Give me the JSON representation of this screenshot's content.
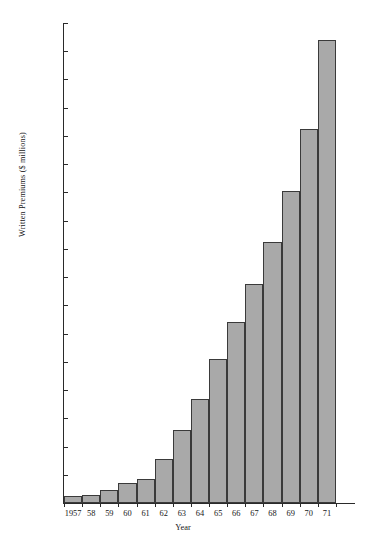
{
  "chart_data": {
    "type": "bar",
    "title": "",
    "xlabel": "Year",
    "ylabel": "Written Premiums ($ millions)",
    "categories": [
      "1957",
      "58",
      "59",
      "60",
      "61",
      "62",
      "63",
      "64",
      "65",
      "66",
      "67",
      "68",
      "69",
      "70",
      "71"
    ],
    "values": [
      25,
      30,
      45,
      70,
      85,
      155,
      260,
      370,
      510,
      640,
      775,
      925,
      1105,
      1325,
      1640
    ],
    "ylim": [
      0,
      1700
    ],
    "yticks": [
      0,
      100,
      200,
      300,
      400,
      500,
      600,
      700,
      800,
      900,
      1000,
      1100,
      1200,
      1300,
      1400,
      1500,
      1600,
      1700
    ],
    "ytick_labels": [
      "0",
      "100",
      "200",
      "300",
      "400",
      "500",
      "600",
      "700",
      "800",
      "900",
      "1000",
      "1100",
      "1200",
      "1300",
      "1400",
      "1500",
      "1600",
      "1700"
    ],
    "grid": false,
    "legend": false,
    "bar_color": "#a9a9a9",
    "bar_edge_color": "#3a3a3a",
    "axis_color": "#2a2a2a",
    "background_color": "#ffffff"
  }
}
